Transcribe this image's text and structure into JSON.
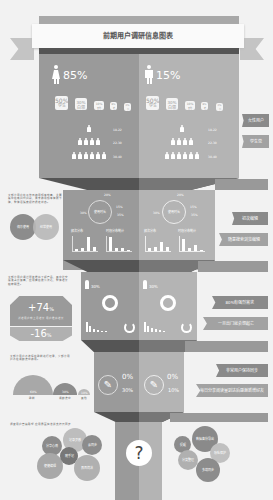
{
  "header": {
    "title": "前期用户调研信息图表"
  },
  "gender": {
    "female": {
      "percent": "85%",
      "icon": "female-icon"
    },
    "male": {
      "percent": "15%",
      "icon": "male-icon"
    }
  },
  "cards": {
    "female": [
      {
        "value": "50%",
        "label": "学生"
      },
      {
        "value": "30%",
        "label": "白领"
      },
      {
        "value": "10%",
        "label": "其他"
      },
      {
        "value": "8%",
        "label": "老"
      },
      {
        "value": "2%",
        "label": "小"
      }
    ],
    "male": [
      {
        "value": "50%",
        "label": "学生"
      },
      {
        "value": "30%",
        "label": "白领"
      },
      {
        "value": "10%",
        "label": "其他"
      },
      {
        "value": "8%",
        "label": "老"
      },
      {
        "value": "2%",
        "label": "小"
      }
    ]
  },
  "pyramid": {
    "female": [
      "18-22",
      "22-30",
      "30-40"
    ],
    "male": [
      "18-22",
      "22-30",
      "30-40"
    ]
  },
  "ribbons": {
    "r1": "女性用户",
    "r2": "学生党",
    "r3": "初次编辑",
    "r4": "随意搜索浏览编辑",
    "r5": "80%有强烈需求",
    "r6": "一旦出门就会想起它",
    "r7": "非常用户保持同步",
    "r8": "每日分享阅读量到达后感谢新增好友"
  },
  "section2": {
    "desc": "大部分用户在工作日使用频率较高，主要集中在晚间时间段，周末使用频率有所下降，整体活跃度保持稳定状态。",
    "venn": [
      "偶尔使用",
      "经常使用"
    ],
    "donut_left": {
      "center": "使用时长",
      "labels": [
        "20%",
        "15%",
        "30%",
        "35%"
      ]
    },
    "donut_right": {
      "center": "使用时长",
      "labels": [
        "20%",
        "15%",
        "30%",
        "35%"
      ]
    },
    "bars_left_a": {
      "title": "频次分布",
      "values": [
        2,
        3,
        9,
        3
      ]
    },
    "bars_left_b": {
      "title": "时段分布统计",
      "values": [
        9,
        2,
        2,
        1
      ]
    },
    "bars_right_a": {
      "title": "频次分布",
      "values": [
        2,
        3,
        6,
        3
      ]
    },
    "bars_right_b": {
      "title": "时段分布统计",
      "values": [
        8,
        2,
        4,
        1
      ]
    }
  },
  "section3": {
    "desc": "大部分用户通过朋友推荐了解产品，其中社交渠道占比最高，应用商店搜索次之，整体增长趋势明显。",
    "plus": "+74",
    "plus_unit": "%",
    "plus_sub": "新增用户  较上月增长  用户推荐增长",
    "minus": "-16",
    "minus_unit": "%",
    "female_pct": "30%",
    "male_pct": "30%"
  },
  "section4": {
    "desc": "大部分用户会选择在睡前进行记录，少部分用户会在通勤途中使用。",
    "arcs": [
      {
        "value": "60%",
        "label": "睡前"
      },
      {
        "value": "30%",
        "label": "通勤途中"
      },
      {
        "value": "10%",
        "label": "其他"
      }
    ],
    "left": {
      "top": "0%",
      "bottom": "30%"
    },
    "right": {
      "top": "0%",
      "bottom": "10%"
    }
  },
  "section5": {
    "desc": "调查用户普遍希望 应用界面简洁并支持云同步",
    "question": "?",
    "left_bubbles": [
      "记录灵感",
      "分享心情",
      "云同步",
      "便捷编辑",
      "随手记",
      "界面简洁"
    ],
    "right_bubbles": [
      "提醒",
      "数据备份导出",
      "隐私保护",
      "分类整理",
      "多端同步"
    ]
  }
}
